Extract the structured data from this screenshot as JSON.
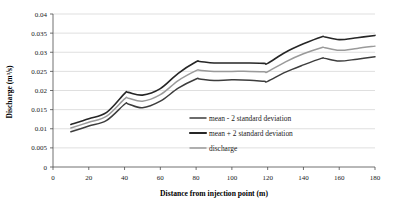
{
  "chart_data": {
    "type": "line",
    "title": "",
    "xlabel": "Distance from injection point (m)",
    "ylabel": "Discharge (m³/s)",
    "xlim": [
      0,
      180
    ],
    "ylim": [
      0,
      0.04
    ],
    "xticks": [
      0,
      20,
      40,
      60,
      80,
      100,
      120,
      140,
      160,
      180
    ],
    "xtick_labels": [
      "0",
      "20",
      "40",
      "60",
      "80",
      "100",
      "120",
      "140",
      "160",
      "180"
    ],
    "yticks": [
      0,
      0.005,
      0.01,
      0.015,
      0.02,
      0.025,
      0.03,
      0.035,
      0.04
    ],
    "ytick_labels": [
      "0",
      "0.005",
      "0.01",
      "0.015",
      "0.02",
      "0.025",
      "0.03",
      "0.035",
      "0.04"
    ],
    "grid": "horizontal",
    "legend_position": "inside-lower-right",
    "x": [
      10,
      20,
      30,
      40,
      42,
      50,
      60,
      70,
      80,
      82,
      90,
      100,
      110,
      118,
      120,
      130,
      140,
      150,
      152,
      160,
      170,
      180
    ],
    "series": [
      {
        "name": "mean + 2 standard deviation",
        "color": "#262626",
        "width": 1.6,
        "values": [
          0.0111,
          0.0126,
          0.0143,
          0.0192,
          0.0195,
          0.0188,
          0.0205,
          0.0245,
          0.0275,
          0.0276,
          0.0272,
          0.0272,
          0.0272,
          0.0271,
          0.0271,
          0.03,
          0.0322,
          0.034,
          0.034,
          0.0333,
          0.0338,
          0.0344
        ]
      },
      {
        "name": "discharge",
        "color": "#9a9a9a",
        "width": 1.5,
        "values": [
          0.0102,
          0.0117,
          0.0133,
          0.0178,
          0.018,
          0.0172,
          0.0189,
          0.0226,
          0.0252,
          0.0253,
          0.025,
          0.025,
          0.025,
          0.0249,
          0.0249,
          0.0275,
          0.0296,
          0.0312,
          0.0312,
          0.0305,
          0.031,
          0.0316
        ]
      },
      {
        "name": "mean - 2 standard deviation",
        "color": "#3d3d3d",
        "width": 1.5,
        "values": [
          0.0092,
          0.0107,
          0.0122,
          0.0164,
          0.0165,
          0.0155,
          0.0172,
          0.0206,
          0.023,
          0.023,
          0.0226,
          0.0228,
          0.0227,
          0.0224,
          0.0224,
          0.0248,
          0.0267,
          0.0284,
          0.0284,
          0.0277,
          0.0282,
          0.0288
        ]
      }
    ],
    "legend": [
      {
        "label": "mean - 2 standard deviation",
        "color": "#3d3d3d",
        "width": 1.5
      },
      {
        "label": "mean + 2 standard deviation",
        "color": "#262626",
        "width": 2.1
      },
      {
        "label": "discharge",
        "color": "#9a9a9a",
        "width": 1.4
      }
    ]
  }
}
